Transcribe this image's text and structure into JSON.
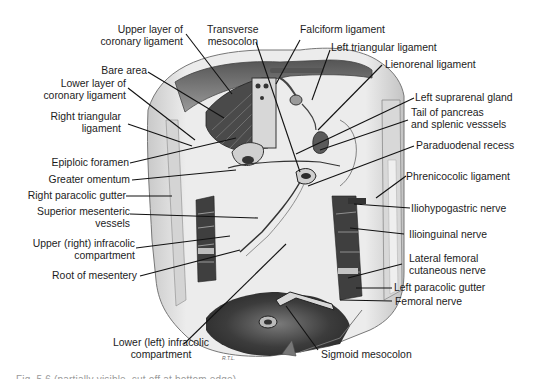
{
  "figure": {
    "type": "anatomical illustration",
    "artist_initials": "R.T.L.",
    "caption_partial": "Fig. 5.6 (partially visible, cut off at bottom edge)"
  },
  "labels": {
    "upper_layer_coronary": "Upper layer of\ncoronary ligament",
    "upper_layer_coronary_l1": "Upper layer of",
    "upper_layer_coronary_l2": "coronary ligament",
    "transverse_mesocolon_l1": "Transverse",
    "transverse_mesocolon_l2": "mesocolon",
    "falciform": "Falciform ligament",
    "left_triangular": "Left triangular ligament",
    "bare_area": "Bare area",
    "lienorenal": "Lienorenal ligament",
    "lower_layer_coronary_l1": "Lower layer of",
    "lower_layer_coronary_l2": "coronary ligament",
    "left_suprarenal": "Left suprarenal gland",
    "right_triangular_l1": "Right triangular",
    "right_triangular_l2": "ligament",
    "tail_pancreas_l1": "Tail of pancreas",
    "tail_pancreas_l2": "and splenic vesssels",
    "epiploic_foramen": "Epiploic foramen",
    "paraduodenal_recess": "Paraduodenal recess",
    "greater_omentum": "Greater omentum",
    "right_paracolic": "Right paracolic gutter",
    "phrenicocolic": "Phrenicocolic ligament",
    "superior_mesenteric_l1": "Superior mesenteric",
    "superior_mesenteric_l2": "vessels",
    "iliohypogastric": "Iliohypogastric nerve",
    "upper_infracolic_l1": "Upper (right) infracolic",
    "upper_infracolic_l2": "compartment",
    "ilioinguinal": "Ilioinguinal nerve",
    "lateral_femoral_l1": "Lateral femoral",
    "lateral_femoral_l2": "cutaneous nerve",
    "root_mesentery": "Root of mesentery",
    "left_paracolic": "Left paracolic gutter",
    "femoral_nerve": "Femoral nerve",
    "lower_infracolic_l1": "Lower (left) infracolic",
    "lower_infracolic_l2": "compartment",
    "sigmoid_mesocolon": "Sigmoid mesocolon"
  },
  "colors": {
    "background": "#ffffff",
    "label_text": "#1c1c1c",
    "leader_line": "#111111",
    "wall_light": "#e6e6e6",
    "wall_mid": "#bdbdbd",
    "shadow_dark": "#3a3a3a"
  }
}
